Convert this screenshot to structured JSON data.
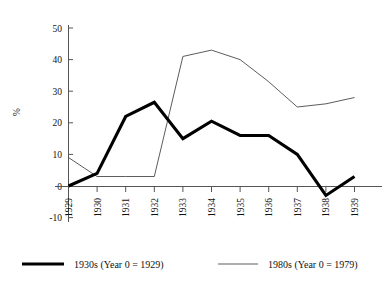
{
  "chart_data": {
    "type": "line",
    "title": "",
    "xlabel": "",
    "ylabel": "%",
    "categories": [
      "1929",
      "1930",
      "1931",
      "1932",
      "1933",
      "1934",
      "1935",
      "1936",
      "1937",
      "1938",
      "1939"
    ],
    "ylim": [
      -10,
      50
    ],
    "yticks": [
      -10,
      0,
      10,
      20,
      30,
      40,
      50
    ],
    "ytick_labels": [
      "-10",
      "0",
      "10",
      "20",
      "30",
      "40",
      "50"
    ],
    "grid": false,
    "legend_position": "bottom",
    "series": [
      {
        "name": "1930s (Year 0 = 1929)",
        "style": "thick",
        "color": "#000000",
        "values": [
          0,
          4,
          22,
          26.5,
          15,
          20.5,
          16,
          16,
          10,
          -3,
          3
        ]
      },
      {
        "name": "1980s (Year 0 = 1979)",
        "style": "thin",
        "color": "#4a4a4a",
        "values": [
          9,
          3,
          3,
          3,
          41,
          43,
          40,
          33,
          25,
          26,
          28
        ]
      }
    ]
  },
  "axis": {
    "y_title": "%",
    "y_tick_labels": [
      "50",
      "40",
      "30",
      "20",
      "10",
      "0",
      "-10"
    ],
    "x_tick_labels": [
      "1929",
      "1930",
      "1931",
      "1932",
      "1933",
      "1934",
      "1935",
      "1936",
      "1937",
      "1938",
      "1939"
    ]
  },
  "legend": {
    "entries": [
      {
        "label": "1930s (Year 0 = 1929)"
      },
      {
        "label": "1980s (Year 0 = 1979)"
      }
    ]
  }
}
